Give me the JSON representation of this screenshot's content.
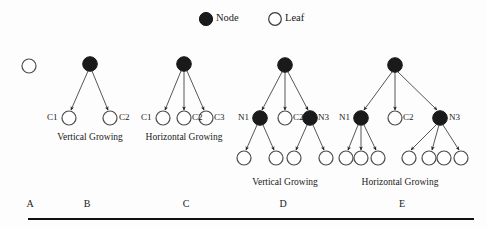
{
  "figure": {
    "colors": {
      "node_fill": "#1a1a1a",
      "leaf_fill": "#ffffff",
      "stroke": "#3a3a3a",
      "text": "#1a1a1a",
      "background": "#fdfdfd"
    }
  },
  "legend": {
    "node": {
      "label": "Node",
      "marker": "filled-circle-icon"
    },
    "leaf": {
      "label": "Leaf",
      "marker": "open-circle-icon"
    }
  },
  "panels": [
    {
      "id": "A",
      "letter": "A",
      "caption": "",
      "node_labels": [],
      "leaf_labels": [],
      "description": "single leaf"
    },
    {
      "id": "B",
      "letter": "B",
      "caption": "Vertical Growing",
      "node_labels": [],
      "leaf_labels": [
        "C1",
        "C2"
      ],
      "description": "root node with two leaf children"
    },
    {
      "id": "C",
      "letter": "C",
      "caption": "Horizontal Growing",
      "node_labels": [],
      "leaf_labels": [
        "C1",
        "C2",
        "C3"
      ],
      "description": "root node with three leaf children"
    },
    {
      "id": "D",
      "letter": "D",
      "caption": "Vertical Growing",
      "node_labels": [
        "N1",
        "N3"
      ],
      "leaf_labels": [
        "C2"
      ],
      "description": "root node with children N1, C2, N3; N1 and N3 each have two leaves"
    },
    {
      "id": "E",
      "letter": "E",
      "caption": "Horizontal Growing",
      "node_labels": [
        "N1",
        "N3"
      ],
      "leaf_labels": [
        "C2"
      ],
      "description": "root node with children N1, C2, N3; N1 and N3 each have three leaves"
    }
  ],
  "labels": {
    "legend_node": "Node",
    "legend_leaf": "Leaf",
    "b_c1": "C1",
    "b_c2": "C2",
    "b_caption": "Vertical Growing",
    "c_c1": "C1",
    "c_c2": "C2",
    "c_c3": "C3",
    "c_caption": "Horizontal Growing",
    "d_n1": "N1",
    "d_c2": "C2",
    "d_n3": "N3",
    "d_caption": "Vertical Growing",
    "e_n1": "N1",
    "e_c2": "C2",
    "e_n3": "N3",
    "e_caption": "Horizontal Growing",
    "letter_a": "A",
    "letter_b": "B",
    "letter_c": "C",
    "letter_d": "D",
    "letter_e": "E"
  }
}
